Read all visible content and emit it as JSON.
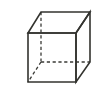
{
  "figure": {
    "label": "A.",
    "shape_name": "cube",
    "projection": "oblique",
    "line_color": "#33332f",
    "hidden_line_color": "#3a3a36",
    "background_color": "#ffffff",
    "canvas": {
      "width": 103,
      "height": 92
    },
    "vertices": {
      "front_top_left": [
        28,
        33
      ],
      "front_top_right": [
        76,
        33
      ],
      "front_bottom_right": [
        76,
        82
      ],
      "front_bottom_left": [
        28,
        82
      ],
      "back_top_left": [
        41,
        12
      ],
      "back_top_right": [
        90,
        12
      ],
      "back_bottom_right": [
        90,
        62
      ],
      "back_bottom_left": [
        41,
        62
      ]
    },
    "visible_edges": [
      "front_top_left-front_top_right",
      "front_top_right-front_bottom_right",
      "front_bottom_right-front_bottom_left",
      "front_bottom_left-front_top_left",
      "back_top_left-back_top_right",
      "back_top_right-back_bottom_right",
      "front_top_left-back_top_left",
      "front_top_right-back_top_right",
      "front_bottom_right-back_bottom_right"
    ],
    "hidden_edges": [
      "back_bottom_left-back_top_left",
      "back_bottom_left-back_bottom_right",
      "back_bottom_left-front_bottom_left"
    ],
    "paths": {
      "front_face": "M 28 33 L 76 33 L 76 82 L 28 82 Z",
      "top_face": "M 28 33 L 41 12 L 90 12 L 76 33 Z",
      "right_face": "M 76 33 L 90 12 L 90 62 L 76 82 Z",
      "hidden_vertical": "M 41 12 L 41 62",
      "hidden_horizontal": "M 41 62 L 90 62",
      "hidden_diagonal": "M 41 62 L 28 82"
    }
  }
}
